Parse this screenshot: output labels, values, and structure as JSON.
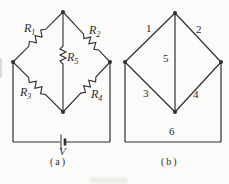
{
  "page": {
    "background": "#fbfbf9",
    "ink": "#2e2e2e"
  },
  "circuit_a": {
    "kind": "wheatstone-bridge-circuit",
    "caption": "(a)",
    "battery_label": "V",
    "resistors": [
      {
        "base": "R",
        "sub": "1",
        "edge": "top-left"
      },
      {
        "base": "R",
        "sub": "2",
        "edge": "top-right"
      },
      {
        "base": "R",
        "sub": "3",
        "edge": "bottom-left"
      },
      {
        "base": "R",
        "sub": "4",
        "edge": "bottom-right"
      },
      {
        "base": "R",
        "sub": "5",
        "edge": "center-vertical"
      }
    ]
  },
  "graph_b": {
    "kind": "graph-of-bridge-circuit",
    "caption": "(b)",
    "edges": [
      {
        "label": "1",
        "edge": "top-left"
      },
      {
        "label": "2",
        "edge": "top-right"
      },
      {
        "label": "3",
        "edge": "bottom-left"
      },
      {
        "label": "4",
        "edge": "bottom-right"
      },
      {
        "label": "5",
        "edge": "center-vertical"
      },
      {
        "label": "6",
        "edge": "bottom-path"
      }
    ]
  }
}
